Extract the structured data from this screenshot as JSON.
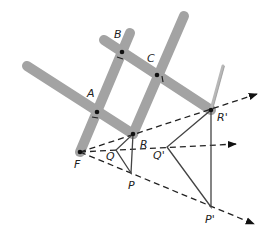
{
  "diagram": {
    "colors": {
      "stick": "#a3a3a3",
      "line": "#222222",
      "background": "#ffffff"
    },
    "labels": {
      "A": "A",
      "B": "B",
      "C": "C",
      "F": "F",
      "R": "R",
      "Q": "Q",
      "P": "P",
      "R_prime": "R'",
      "Q_prime": "Q'",
      "P_prime": "P'"
    },
    "points": {
      "F": [
        80,
        152
      ],
      "A": [
        97,
        112
      ],
      "B": [
        122,
        52
      ],
      "C": [
        157,
        75
      ],
      "R": [
        133,
        134
      ],
      "R_prime": [
        211,
        110
      ],
      "Q": [
        116,
        150
      ],
      "P": [
        131,
        173
      ],
      "Q_prime": [
        167,
        147
      ],
      "P_prime": [
        211,
        207
      ]
    },
    "rays": [
      {
        "from": "F",
        "through": "R_prime",
        "end": [
          257,
          94
        ]
      },
      {
        "from": "F",
        "through": "Q_prime",
        "end": [
          236,
          144
        ]
      },
      {
        "from": "F",
        "through": "P_prime",
        "end": [
          254,
          224
        ]
      }
    ],
    "triangles": [
      [
        "P",
        "Q",
        "R"
      ],
      [
        "P_prime",
        "Q_prime",
        "R_prime"
      ]
    ]
  }
}
